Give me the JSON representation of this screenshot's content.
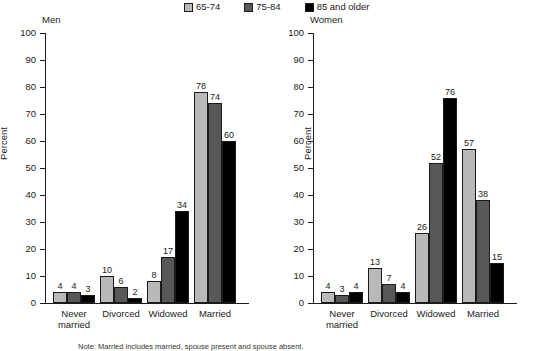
{
  "legend": {
    "items": [
      {
        "label": "65-74",
        "color": "#b9b9b9"
      },
      {
        "label": "75-84",
        "color": "#585858"
      },
      {
        "label": "85 and older",
        "color": "#000000"
      }
    ]
  },
  "footnote": "Note: Married includes married, spouse present and spouse absent.",
  "axis": {
    "ylabel": "Percent",
    "ticks": [
      "0",
      "10",
      "20",
      "30",
      "40",
      "50",
      "60",
      "70",
      "80",
      "90",
      "100"
    ]
  },
  "panels": [
    {
      "title": "Men",
      "ylabel": "Percent",
      "categories": [
        "Never married",
        "Divorced",
        "Widowed",
        "Married"
      ],
      "category_lines": [
        [
          "Never",
          "married"
        ],
        [
          "Divorced"
        ],
        [
          "Widowed"
        ],
        [
          "Married"
        ]
      ],
      "values": {
        "s0": [
          4,
          10,
          8,
          78
        ],
        "s1": [
          4,
          6,
          17,
          74
        ],
        "s2": [
          3,
          2,
          34,
          60
        ]
      }
    },
    {
      "title": "Women",
      "ylabel": "Percent",
      "categories": [
        "Never married",
        "Divorced",
        "Widowed",
        "Married"
      ],
      "category_lines": [
        [
          "Never",
          "married"
        ],
        [
          "Divorced"
        ],
        [
          "Widowed"
        ],
        [
          "Married"
        ]
      ],
      "values": {
        "s0": [
          4,
          13,
          26,
          57
        ],
        "s1": [
          3,
          7,
          52,
          38
        ],
        "s2": [
          4,
          4,
          76,
          15
        ]
      }
    }
  ],
  "chart_data": {
    "type": "bar",
    "xlabel": "",
    "ylabel": "Percent",
    "ylim": [
      0,
      100
    ],
    "ytick_step": 10,
    "grid": false,
    "legend_position": "top",
    "legend_entries": [
      "65-74",
      "75-84",
      "85 and older"
    ],
    "annotations": [
      "Note: Married includes married, spouse present and spouse absent."
    ],
    "panels": [
      {
        "name": "Men",
        "categories": [
          "Never married",
          "Divorced",
          "Widowed",
          "Married"
        ],
        "series": [
          {
            "name": "65-74",
            "values": [
              4,
              10,
              8,
              78
            ]
          },
          {
            "name": "75-84",
            "values": [
              4,
              6,
              17,
              74
            ]
          },
          {
            "name": "85 and older",
            "values": [
              3,
              2,
              34,
              60
            ]
          }
        ]
      },
      {
        "name": "Women",
        "categories": [
          "Never married",
          "Divorced",
          "Widowed",
          "Married"
        ],
        "series": [
          {
            "name": "65-74",
            "values": [
              4,
              13,
              26,
              57
            ]
          },
          {
            "name": "75-84",
            "values": [
              3,
              7,
              52,
              38
            ]
          },
          {
            "name": "85 and older",
            "values": [
              4,
              4,
              76,
              15
            ]
          }
        ]
      }
    ]
  }
}
